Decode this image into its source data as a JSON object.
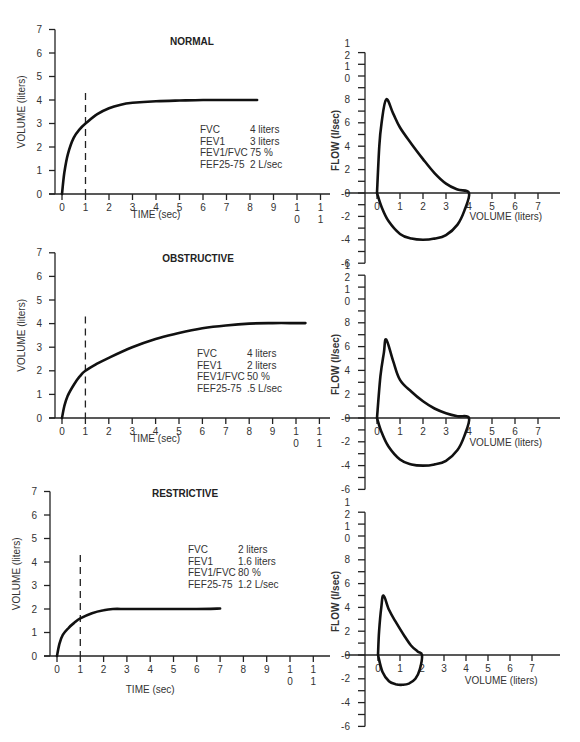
{
  "chart_data": [
    {
      "type": "line",
      "title": "NORMAL",
      "xlabel": "TIME (sec)",
      "ylabel": "VOLUME (liters)",
      "x_ticks": [
        "0",
        "1",
        "2",
        "3",
        "4",
        "5",
        "6",
        "7",
        "8",
        "9",
        "10",
        "11"
      ],
      "y_ticks": [
        "0",
        "1",
        "2",
        "3",
        "4",
        "5",
        "6",
        "7"
      ],
      "xlim": [
        0,
        11
      ],
      "ylim": [
        0,
        7
      ],
      "fev1_marker_x": 1,
      "series": [
        {
          "name": "Volume-time curve",
          "x": [
            0,
            0.1,
            0.25,
            0.5,
            0.75,
            1,
            1.5,
            2,
            2.5,
            3,
            4,
            5,
            6,
            7,
            8,
            8.3
          ],
          "y": [
            0,
            0.9,
            1.7,
            2.4,
            2.75,
            3.0,
            3.4,
            3.65,
            3.8,
            3.88,
            3.95,
            3.98,
            4,
            4,
            4,
            4
          ]
        }
      ],
      "stats": [
        {
          "label": "FVC",
          "value": "4 liters"
        },
        {
          "label": "FEV1",
          "value": "3 liters"
        },
        {
          "label": "FEV1/FVC",
          "value": "75 %"
        },
        {
          "label": "FEF25-75",
          "value": "2 L/sec"
        }
      ]
    },
    {
      "type": "line",
      "title": "",
      "xlabel": "VOLUME (liters)",
      "ylabel": "FLOW (l/sec)",
      "x_ticks": [
        "0",
        "1",
        "2",
        "3",
        "4",
        "5",
        "6",
        "7"
      ],
      "y_ticks": [
        "-6",
        "-4",
        "-2",
        "0",
        "2",
        "4",
        "6",
        "8",
        "10",
        "12"
      ],
      "xlim": [
        0,
        7
      ],
      "ylim": [
        -6,
        12
      ],
      "series": [
        {
          "name": "Flow-volume loop",
          "x": [
            0,
            0.1,
            0.2,
            0.4,
            0.7,
            1,
            1.5,
            2,
            2.5,
            3,
            3.5,
            4,
            3.8,
            3.5,
            3,
            2.5,
            2,
            1.5,
            1,
            0.5,
            0.2,
            0
          ],
          "y": [
            0,
            4,
            6,
            8,
            6.8,
            5.6,
            4.2,
            2.9,
            1.7,
            0.8,
            0.3,
            0,
            -1.5,
            -2.7,
            -3.6,
            -3.9,
            -4,
            -3.9,
            -3.5,
            -2.4,
            -1.2,
            0
          ]
        }
      ]
    },
    {
      "type": "line",
      "title": "OBSTRUCTIVE",
      "xlabel": "TIME (sec)",
      "ylabel": "VOLUME (liters)",
      "x_ticks": [
        "0",
        "1",
        "2",
        "3",
        "4",
        "5",
        "6",
        "7",
        "8",
        "9",
        "10",
        "11"
      ],
      "y_ticks": [
        "0",
        "1",
        "2",
        "3",
        "4",
        "5",
        "6",
        "7"
      ],
      "xlim": [
        0,
        11
      ],
      "ylim": [
        0,
        7
      ],
      "fev1_marker_x": 1,
      "series": [
        {
          "name": "Volume-time curve",
          "x": [
            0,
            0.1,
            0.25,
            0.5,
            0.75,
            1,
            1.5,
            2,
            3,
            4,
            5,
            6,
            7,
            8,
            9,
            10,
            10.4
          ],
          "y": [
            0,
            0.5,
            0.95,
            1.4,
            1.75,
            2.0,
            2.3,
            2.55,
            3.0,
            3.35,
            3.6,
            3.8,
            3.92,
            4.0,
            4.02,
            4.02,
            4.02
          ]
        }
      ],
      "stats": [
        {
          "label": "FVC",
          "value": "4 liters"
        },
        {
          "label": "FEV1",
          "value": "2 liters"
        },
        {
          "label": "FEV1/FVC",
          "value": "50 %"
        },
        {
          "label": "FEF25-75",
          "value": ".5 L/sec"
        }
      ]
    },
    {
      "type": "line",
      "title": "",
      "xlabel": "VOLUME (liters)",
      "ylabel": "FLOW (l/sec)",
      "x_ticks": [
        "0",
        "1",
        "2",
        "3",
        "4",
        "5",
        "6",
        "7"
      ],
      "y_ticks": [
        "-6",
        "-4",
        "-2",
        "0",
        "2",
        "4",
        "6",
        "8",
        "10",
        "12"
      ],
      "xlim": [
        0,
        7
      ],
      "ylim": [
        -6,
        12
      ],
      "series": [
        {
          "name": "Flow-volume loop",
          "x": [
            0,
            0.15,
            0.3,
            0.4,
            0.7,
            1,
            1.5,
            2,
            2.5,
            3,
            3.5,
            4,
            3.8,
            3.5,
            3,
            2.5,
            2,
            1.5,
            1,
            0.5,
            0.2,
            0
          ],
          "y": [
            0,
            3.5,
            5.5,
            6.6,
            4.8,
            3.2,
            2.2,
            1.4,
            0.8,
            0.4,
            0.15,
            0,
            -1.5,
            -2.7,
            -3.6,
            -3.9,
            -4,
            -3.9,
            -3.5,
            -2.4,
            -1.2,
            0
          ]
        }
      ]
    },
    {
      "type": "line",
      "title": "RESTRICTIVE",
      "xlabel": "TIME (sec)",
      "ylabel": "VOLUME (liters)",
      "x_ticks": [
        "0",
        "1",
        "2",
        "3",
        "4",
        "5",
        "6",
        "7",
        "8",
        "9",
        "10",
        "11"
      ],
      "y_ticks": [
        "0",
        "1",
        "2",
        "3",
        "4",
        "5",
        "6",
        "7"
      ],
      "xlim": [
        0,
        11
      ],
      "ylim": [
        0,
        7
      ],
      "fev1_marker_x": 1,
      "series": [
        {
          "name": "Volume-time curve",
          "x": [
            0,
            0.1,
            0.25,
            0.5,
            0.75,
            1,
            1.5,
            2,
            2.4,
            3,
            4,
            5,
            6,
            7
          ],
          "y": [
            0,
            0.5,
            0.9,
            1.2,
            1.42,
            1.6,
            1.82,
            1.95,
            2.0,
            2.0,
            2.0,
            2.0,
            2.0,
            2.02
          ]
        }
      ],
      "stats": [
        {
          "label": "FVC",
          "value": "2 liters"
        },
        {
          "label": "FEV1",
          "value": "1.6 liters"
        },
        {
          "label": "FEV1/FVC",
          "value": "80 %"
        },
        {
          "label": "FEF25-75",
          "value": "1.2 L/sec"
        }
      ]
    },
    {
      "type": "line",
      "title": "",
      "xlabel": "VOLUME (liters)",
      "ylabel": "FLOW (l/sec)",
      "x_ticks": [
        "0",
        "1",
        "2",
        "3",
        "4",
        "5",
        "6",
        "7"
      ],
      "y_ticks": [
        "-6",
        "-4",
        "-2",
        "0",
        "2",
        "4",
        "6",
        "8",
        "10",
        "12"
      ],
      "xlim": [
        0,
        7
      ],
      "ylim": [
        -6,
        12
      ],
      "series": [
        {
          "name": "Flow-volume loop",
          "x": [
            0,
            0.05,
            0.15,
            0.25,
            0.5,
            0.8,
            1.2,
            1.5,
            1.8,
            2,
            1.9,
            1.7,
            1.4,
            1.1,
            0.8,
            0.5,
            0.2,
            0
          ],
          "y": [
            0,
            2,
            4,
            5,
            3.8,
            2.8,
            1.6,
            0.8,
            0.3,
            0,
            -1.2,
            -2,
            -2.4,
            -2.5,
            -2.45,
            -2.2,
            -1.4,
            0
          ]
        }
      ]
    }
  ]
}
